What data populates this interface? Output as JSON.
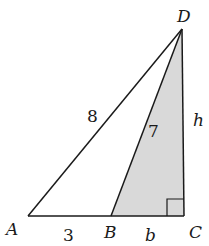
{
  "figure": {
    "type": "geometry-diagram",
    "colors": {
      "stroke": "#1a1a1a",
      "shade": "#d9d9d9",
      "background": "#ffffff"
    },
    "points": [
      {
        "name": "A",
        "x": 28,
        "y": 216
      },
      {
        "name": "B",
        "x": 111,
        "y": 216
      },
      {
        "name": "C",
        "x": 184,
        "y": 216
      },
      {
        "name": "D",
        "x": 182,
        "y": 29
      }
    ],
    "vertex_labels": {
      "A": "A",
      "B": "B",
      "C": "C",
      "D": "D"
    },
    "segment_labels": {
      "AD": "8",
      "BD": "7",
      "AB": "3",
      "BC": "b",
      "CD": "h"
    },
    "right_angle_at": "C",
    "shaded_region": "triangle BCD"
  }
}
